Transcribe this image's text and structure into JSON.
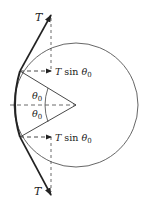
{
  "diagram": {
    "type": "free-body / tension on circular arc",
    "labels": {
      "tension_top": "T",
      "tension_bottom": "T",
      "component_top_T": "T",
      "component_top_sin": " sin ",
      "component_top_theta": "θ",
      "component_top_sub": "0",
      "component_bottom_T": "T",
      "component_bottom_sin": " sin ",
      "component_bottom_theta": "θ",
      "component_bottom_sub": "0",
      "angle_top_theta": "θ",
      "angle_top_sub": "0",
      "angle_bottom_theta": "θ",
      "angle_bottom_sub": "0"
    },
    "colors": {
      "stroke": "#222222",
      "circle": "#555555",
      "dashed": "#444444"
    }
  }
}
